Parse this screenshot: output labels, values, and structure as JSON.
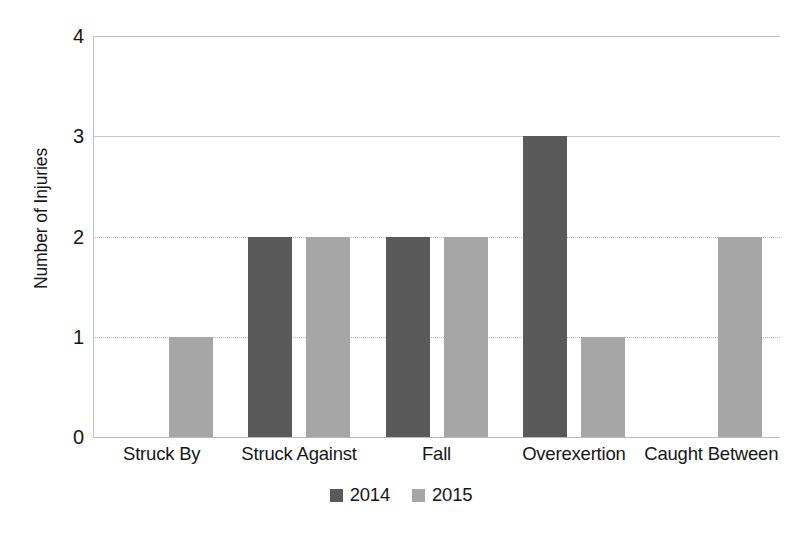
{
  "chart_data": {
    "type": "bar",
    "title": "",
    "subtitle": "",
    "xlabel": "",
    "ylabel": "Number of Injuries",
    "categories": [
      "Struck By",
      "Struck Against",
      "Fall",
      "Overexertion",
      "Caught Between"
    ],
    "series": [
      {
        "name": "2014",
        "color": "#595959",
        "values": [
          null,
          2,
          2,
          3,
          null
        ]
      },
      {
        "name": "2015",
        "color": "#a6a6a6",
        "values": [
          1,
          2,
          2,
          1,
          2
        ]
      }
    ],
    "ylim": [
      0,
      4
    ],
    "yticks": [
      0,
      1,
      2,
      3,
      4
    ],
    "ytick_labels": [
      "0",
      "1",
      "2",
      "3",
      "4"
    ],
    "gridlines": {
      "horizontal": true,
      "vertical": false,
      "styles": {
        "0": "solid",
        "1": "dotted",
        "2": "dotted",
        "3": "solid",
        "4": "solid"
      }
    },
    "legend": {
      "position": "bottom-center",
      "entries": [
        {
          "label": "2014",
          "color": "#595959"
        },
        {
          "label": "2015",
          "color": "#a6a6a6"
        }
      ]
    },
    "background_color": "#ffffff",
    "axis_color": "#c2c2c2",
    "text_color": "#161616"
  }
}
